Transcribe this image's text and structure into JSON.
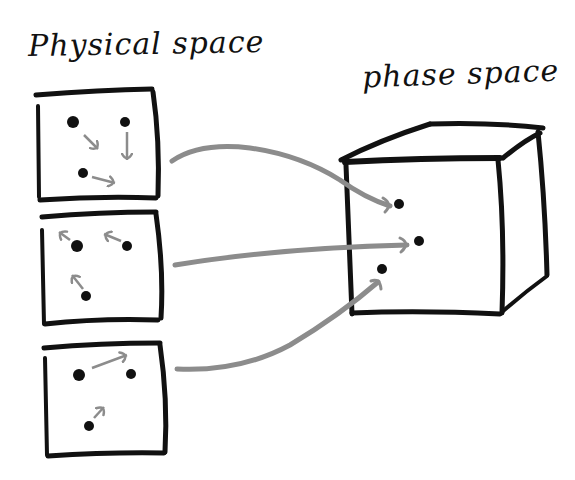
{
  "labels": {
    "physical_space": "Physical space",
    "phase_space": "phase space"
  },
  "colors": {
    "ink": "#111111",
    "arrow": "#8c8c8c",
    "background": "#ffffff"
  },
  "physical_boxes": [
    {
      "id": "box-1",
      "particles": [
        {
          "x": 73,
          "y": 122,
          "r": 6,
          "velocity": "down-right"
        },
        {
          "x": 125,
          "y": 122,
          "r": 5,
          "velocity": "down"
        },
        {
          "x": 83,
          "y": 173,
          "r": 5,
          "velocity": "right"
        }
      ]
    },
    {
      "id": "box-2",
      "particles": [
        {
          "x": 77,
          "y": 246,
          "r": 6,
          "velocity": "up-left"
        },
        {
          "x": 127,
          "y": 246,
          "r": 5,
          "velocity": "up-left"
        },
        {
          "x": 86,
          "y": 296,
          "r": 5,
          "velocity": "up"
        }
      ]
    },
    {
      "id": "box-3",
      "particles": [
        {
          "x": 79,
          "y": 375,
          "r": 6,
          "velocity": "none"
        },
        {
          "x": 131,
          "y": 374,
          "r": 5,
          "velocity": "none"
        },
        {
          "x": 89,
          "y": 426,
          "r": 5,
          "velocity": "up-right"
        }
      ],
      "extra_arrow": "from first particle toward second (right, slightly up)"
    }
  ],
  "phase_space_points": [
    {
      "x": 399,
      "y": 204,
      "r": 5
    },
    {
      "x": 419,
      "y": 241,
      "r": 5
    },
    {
      "x": 382,
      "y": 269,
      "r": 5
    }
  ],
  "mappings": [
    {
      "from": "box-1",
      "to": "phase_point_1"
    },
    {
      "from": "box-2",
      "to": "phase_point_2"
    },
    {
      "from": "box-3",
      "to": "phase_point_3"
    }
  ]
}
